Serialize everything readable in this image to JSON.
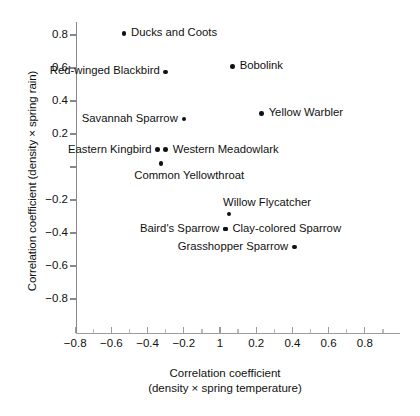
{
  "chart_data": {
    "type": "scatter",
    "title": "",
    "xlabel": "Correlation coefficient (density × spring temperature)",
    "xlabel_line1": "Correlation coefficient",
    "xlabel_line2": "(density × spring temperature)",
    "ylabel": "Correlation coefficient (density × spring rain)",
    "xlim": [
      -0.95,
      0.95
    ],
    "ylim": [
      -0.98,
      0.95
    ],
    "xticks": [
      "-0.8",
      "-0.6",
      "-0.4",
      "-0.2",
      "1",
      "0.2",
      "0.4",
      "0.6",
      "0.8"
    ],
    "xtick_values": [
      -0.8,
      -0.6,
      -0.4,
      -0.2,
      0,
      0.2,
      0.4,
      0.6,
      0.8
    ],
    "yticks": [
      "0.8",
      "0.6",
      "0.4",
      "0.2",
      "",
      "-0.2",
      "-0.4",
      "-0.6",
      "-0.8"
    ],
    "ytick_values": [
      0.8,
      0.6,
      0.4,
      0.2,
      0,
      -0.2,
      -0.4,
      -0.6,
      -0.8
    ],
    "grid": false,
    "legend": "none",
    "marker_color": "#111111",
    "points": [
      {
        "name": "Ducks and Coots",
        "x": -0.53,
        "y": 0.81,
        "label": "Ducks and Coots",
        "label_pos": "right"
      },
      {
        "name": "Red-winged Blackbird",
        "x": -0.3,
        "y": 0.575,
        "label": "Red-winged Blackbird",
        "label_pos": "left-2line"
      },
      {
        "name": "Bobolink",
        "x": 0.07,
        "y": 0.61,
        "label": "Bobolink",
        "label_pos": "right"
      },
      {
        "name": "Yellow Warbler",
        "x": 0.23,
        "y": 0.325,
        "label": "Yellow Warbler",
        "label_pos": "right"
      },
      {
        "name": "Savannah Sparrow",
        "x": -0.2,
        "y": 0.29,
        "label": "Savannah Sparrow",
        "label_pos": "left"
      },
      {
        "name": "Eastern Kingbird",
        "x": -0.345,
        "y": 0.105,
        "label": "Eastern Kingbird",
        "label_pos": "left"
      },
      {
        "name": "Western Meadowlark",
        "x": -0.3,
        "y": 0.105,
        "label": "Western Meadowlark",
        "label_pos": "right"
      },
      {
        "name": "Common Yellowthroat",
        "x": -0.325,
        "y": 0.02,
        "label": "Common Yellowthroat",
        "label_pos": "below"
      },
      {
        "name": "Willow Flycatcher",
        "x": 0.05,
        "y": -0.285,
        "label": "Willow Flycatcher",
        "label_pos": "above"
      },
      {
        "name": "Clay-colored Sparrow",
        "x": 0.03,
        "y": -0.375,
        "label": "Clay-colored Sparrow",
        "label_pos": "right"
      },
      {
        "name": "Baird's Sparrow",
        "x": 0.03,
        "y": -0.375,
        "label": "Baird's Sparrow",
        "label_pos": "left"
      },
      {
        "name": "Grasshopper Sparrow",
        "x": 0.41,
        "y": -0.485,
        "label": "Grasshopper Sparrow",
        "label_pos": "left"
      }
    ]
  }
}
